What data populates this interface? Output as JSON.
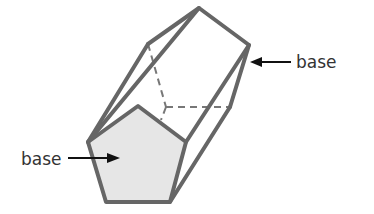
{
  "diagram": {
    "labels": {
      "top_base": "base",
      "bottom_base": "base"
    },
    "colors": {
      "edge": "#666666",
      "fill": "#e6e6e6",
      "text": "#333333",
      "arrow": "#111111"
    }
  }
}
